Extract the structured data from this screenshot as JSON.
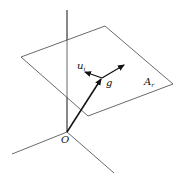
{
  "diagram": {
    "type": "3d-vector-plane",
    "labels": {
      "origin": "O",
      "vector": "g",
      "unit_vector": "u",
      "unit_vector_sub": "i",
      "plane": "A",
      "plane_sub": "r"
    },
    "colors": {
      "line": "#333333",
      "arrow": "#111111",
      "background": "#ffffff"
    }
  }
}
